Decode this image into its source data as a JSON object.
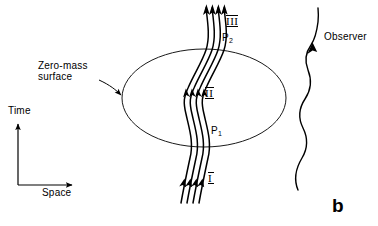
{
  "figure": {
    "panel_label": "b",
    "caption_labels": {
      "zero_mass_surface_line1": "Zero-mass",
      "zero_mass_surface_line2": "surface",
      "observer": "Observer"
    },
    "axes": {
      "time_label": "Time",
      "space_label": "Space"
    },
    "regions": [
      {
        "name": "region-i",
        "label": "I"
      },
      {
        "name": "region-ii",
        "label": "II"
      },
      {
        "name": "region-iii",
        "label": "III"
      }
    ],
    "points": [
      {
        "name": "point-p1",
        "label": "P",
        "subscript": "1"
      },
      {
        "name": "point-p2",
        "label": "P",
        "subscript": "2"
      }
    ],
    "colors": {
      "ink": "#000000",
      "background": "#ffffff",
      "surface_outline": "#1a1a1a"
    },
    "geometry": {
      "ellipse_center_x": 204,
      "ellipse_center_y": 98,
      "ellipse_rx": 82,
      "ellipse_ry": 49,
      "worldline_count": 4,
      "arrowhead_levels": 3
    }
  }
}
